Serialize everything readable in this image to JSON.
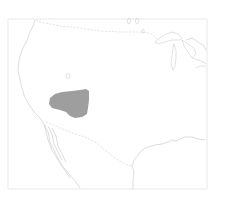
{
  "map": {
    "region": "North America (western United States and northern Mexico)",
    "type": "species range map",
    "range": {
      "label": "range-area",
      "fill_color": "#9e9e9e",
      "approx_location": "Great Basin / Nevada-Utah region"
    },
    "colors": {
      "background": "#ffffff",
      "outline": "#cfcfcf",
      "frame": "#e4e4e4",
      "range_fill": "#9e9e9e"
    }
  }
}
